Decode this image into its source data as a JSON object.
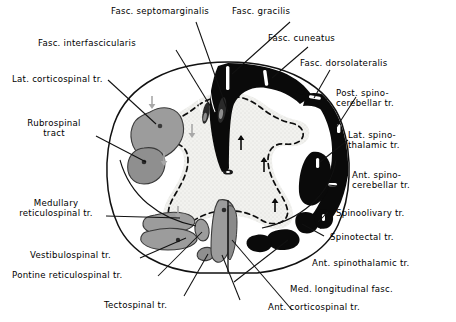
{
  "figure": {
    "colors": {
      "ascending_black": "#0a0a0a",
      "descending_grey": "#9a9a9a",
      "grey_matter_stipple": "#e8e8e4",
      "outline": "#111111",
      "background": "#ffffff"
    }
  },
  "labels": {
    "fasc_septomarginalis": "Fasc. septomarginalis",
    "fasc_gracilis": "Fasc. gracilis",
    "fasc_interfascicularis": "Fasc. interfascicularis",
    "fasc_cuneatus": "Fasc. cuneatus",
    "fasc_dorsolateralis": "Fasc. dorsolateralis",
    "lat_corticospinal": "Lat. corticospinal tr.",
    "post_spinocerebellar": "Post. spino-\ncerebellar tr.",
    "rubrospinal": "Rubrospinal\ntract",
    "lat_spinothalamic": "Lat. spino-\nthalamic tr.",
    "ant_spinocerebellar": "Ant. spino-\ncerebellar tr.",
    "medullary_reticulospinal": "Medullary\nreticulospinal tr.",
    "spinoolivary": "Spinoolivary tr.",
    "vestibulospinal": "Vestibulospinal tr.",
    "spinotectal": "Spinotectal tr.",
    "pontine_reticulospinal": "Pontine reticulospinal tr.",
    "ant_spinothalamic": "Ant. spinothalamic tr.",
    "med_longitudinal_fasc": "Med. longitudinal fasc.",
    "tectospinal": "Tectospinal tr.",
    "ant_corticospinal": "Ant. corticospinal tr."
  },
  "tracts": {
    "ascending": [
      "Fasc. gracilis",
      "Fasc. cuneatus",
      "Fasc. dorsolateralis",
      "Post. spinocerebellar tr.",
      "Lat. spinothalamic tr.",
      "Ant. spinocerebellar tr.",
      "Spinoolivary tr.",
      "Spinotectal tr.",
      "Ant. spinothalamic tr."
    ],
    "descending": [
      "Fasc. septomarginalis",
      "Fasc. interfascicularis",
      "Lat. corticospinal tr.",
      "Rubrospinal tract",
      "Medullary reticulospinal tr.",
      "Vestibulospinal tr.",
      "Pontine reticulospinal tr.",
      "Tectospinal tr.",
      "Med. longitudinal fasc.",
      "Ant. corticospinal tr."
    ]
  }
}
